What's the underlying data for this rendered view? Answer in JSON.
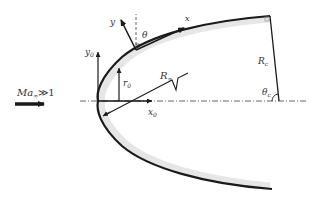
{
  "diagram": {
    "type": "blunt-body-coordinate-schematic",
    "colors": {
      "stroke": "#1a1a1a",
      "shade": "#e6e6e6",
      "text": "#333333"
    },
    "labels": {
      "freestream": "Ma",
      "freestream_sub": "∞",
      "freestream_rel": "≫1",
      "y0": "y",
      "y0_sub": "0",
      "x0": "x",
      "x0_sub": "0",
      "r0": "r",
      "r0_sub": "0",
      "r_inf": "R",
      "r_inf_sub": "∞",
      "y_local": "y",
      "x_local": "x",
      "theta": "θ",
      "rc": "R",
      "rc_sub": "c",
      "theta_c": "θ",
      "theta_c_sub": "c"
    }
  }
}
